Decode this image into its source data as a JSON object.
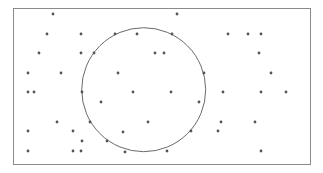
{
  "diagram": {
    "frame": {
      "x": 13.5,
      "y": 8.5,
      "width": 297,
      "height": 156,
      "stroke": "#8a8a8a"
    },
    "circle": {
      "cx": 143.7,
      "cy": 89.7,
      "r": 62,
      "stroke": "#6a6a6a"
    },
    "point_color": "#555555",
    "point_radius": 1.4,
    "points": [
      [
        53,
        14
      ],
      [
        177,
        14
      ],
      [
        47,
        34
      ],
      [
        81,
        34
      ],
      [
        115,
        34
      ],
      [
        137,
        34
      ],
      [
        172,
        34
      ],
      [
        228,
        34
      ],
      [
        248,
        34
      ],
      [
        261,
        34
      ],
      [
        39,
        53
      ],
      [
        81,
        53
      ],
      [
        94,
        53
      ],
      [
        155,
        53
      ],
      [
        164,
        53
      ],
      [
        259,
        53
      ],
      [
        28,
        73
      ],
      [
        61,
        73
      ],
      [
        118,
        73
      ],
      [
        204,
        73
      ],
      [
        271,
        73
      ],
      [
        28,
        92
      ],
      [
        34,
        92
      ],
      [
        82,
        92
      ],
      [
        133,
        92
      ],
      [
        171,
        92
      ],
      [
        223,
        92
      ],
      [
        261,
        92
      ],
      [
        286,
        92
      ],
      [
        101,
        102
      ],
      [
        199,
        102
      ],
      [
        57,
        122
      ],
      [
        90,
        122
      ],
      [
        148,
        122
      ],
      [
        221,
        122
      ],
      [
        255,
        122
      ],
      [
        28,
        131
      ],
      [
        73,
        131
      ],
      [
        123,
        132
      ],
      [
        191,
        131
      ],
      [
        218,
        131
      ],
      [
        82,
        141
      ],
      [
        107,
        141
      ],
      [
        28,
        151
      ],
      [
        73,
        151
      ],
      [
        81,
        151
      ],
      [
        125,
        152
      ],
      [
        167,
        151
      ],
      [
        261,
        151
      ]
    ]
  }
}
